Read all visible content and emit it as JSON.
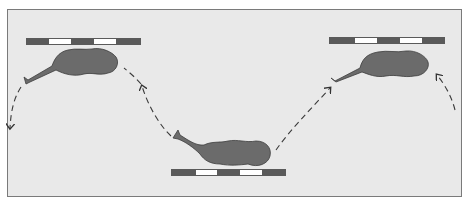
{
  "figure": {
    "colors": {
      "background": "#e9e9e9",
      "organism": "#6d6d6d",
      "scale_dark": "#555555",
      "scale_light": "#ffffff",
      "path": "#3a3a3a"
    },
    "positions": [
      {
        "id": "left",
        "scale_bar_segments": 5
      },
      {
        "id": "bottom-center",
        "scale_bar_segments": 5
      },
      {
        "id": "right",
        "scale_bar_segments": 5
      }
    ]
  }
}
